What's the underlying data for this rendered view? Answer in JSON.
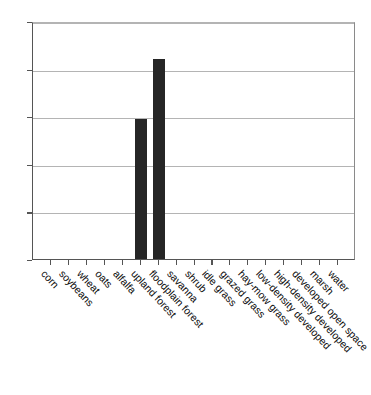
{
  "chart_data": {
    "type": "bar",
    "title": "",
    "subtitle": "",
    "xlabel": "",
    "ylabel": "",
    "ylim": [
      0,
      10
    ],
    "yticks": [
      0,
      2,
      4,
      6,
      8,
      10
    ],
    "ytick_labels": [
      "0",
      "2",
      "4",
      "6",
      "8",
      "10"
    ],
    "grid": "horizontal",
    "legend": "none",
    "bar_color": "#262626",
    "gridline_color": "#b4b4b4",
    "axis_color": "#555555",
    "categories": [
      "corn",
      "soybeans",
      "wheat",
      "oats",
      "alfalfa",
      "upland forest",
      "floodplain forest",
      "savanna",
      "shrub",
      "idle grass",
      "grazed grass",
      "hay-mow grass",
      "low-density developed",
      "high-density developed",
      "developed open space",
      "marsh",
      "water"
    ],
    "values": [
      0,
      0,
      0,
      0,
      0,
      5.9,
      8.4,
      0,
      0,
      0,
      0,
      0,
      0,
      0,
      0,
      0,
      0
    ]
  }
}
